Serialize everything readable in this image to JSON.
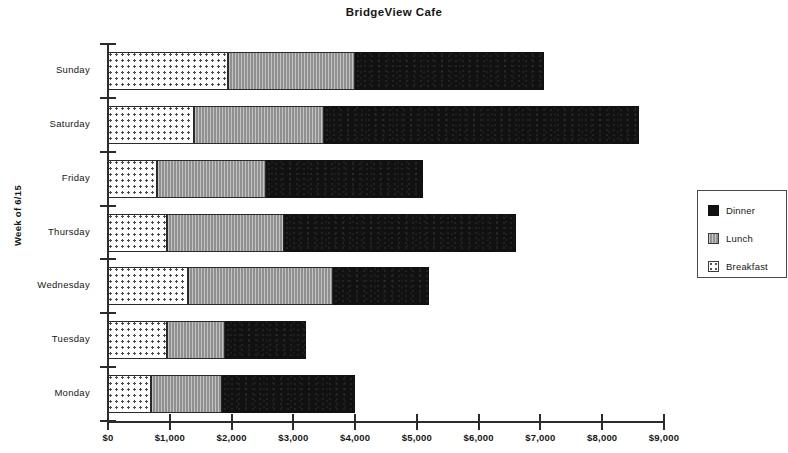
{
  "chart_data": {
    "type": "bar",
    "orientation": "horizontal",
    "stacked": true,
    "title": "BridgeView Cafe",
    "xlabel": "",
    "ylabel": "Week of 6/15",
    "categories": [
      "Sunday",
      "Saturday",
      "Friday",
      "Thursday",
      "Wednesday",
      "Tuesday",
      "Monday"
    ],
    "series": [
      {
        "name": "Breakfast",
        "color": "#ffffff",
        "pattern": "dotted",
        "values": [
          1950,
          1400,
          800,
          950,
          1300,
          950,
          700
        ]
      },
      {
        "name": "Lunch",
        "color": "#9f9f9f",
        "pattern": "vertical-lines",
        "values": [
          2050,
          2100,
          1750,
          1900,
          2350,
          950,
          1150
        ]
      },
      {
        "name": "Dinner",
        "color": "#111111",
        "pattern": "solid",
        "values": [
          3050,
          5100,
          2550,
          3750,
          1550,
          1300,
          2150
        ]
      }
    ],
    "totals": [
      7050,
      8600,
      5100,
      6600,
      5200,
      3200,
      4000
    ],
    "xlim": [
      0,
      9000
    ],
    "xticks": [
      0,
      1000,
      2000,
      3000,
      4000,
      5000,
      6000,
      7000,
      8000,
      9000
    ],
    "xtick_labels": [
      "$0",
      "$1,000",
      "$2,000",
      "$3,000",
      "$4,000",
      "$5,000",
      "$6,000",
      "$7,000",
      "$8,000",
      "$9,000"
    ],
    "grid": false,
    "legend_position": "right",
    "legend_entries": [
      "Dinner",
      "Lunch",
      "Breakfast"
    ]
  }
}
